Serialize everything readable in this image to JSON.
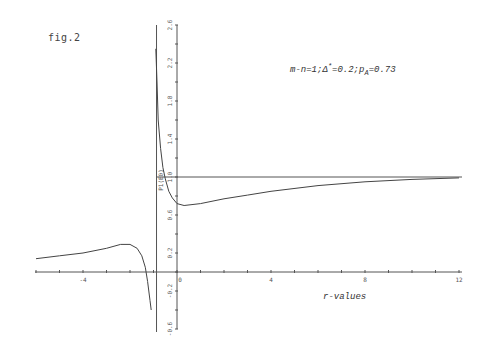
{
  "figure": {
    "label": "fig.2",
    "annotation": "m-n=1;Δ*=0.2;pA=0.73",
    "annotation_parts": {
      "prefix": "m-n=1;Δ",
      "sup": "*",
      "mid": "=0.2;p",
      "sub": "A",
      "suffix": "=0.73"
    },
    "xlabel": "r-values",
    "ylabel_rotated": "P1(E0)"
  },
  "chart_data": {
    "type": "line",
    "title": "fig.2",
    "annotation": "m-n=1; Δ*=0.2; p_A=0.73",
    "xlabel": "r-values",
    "ylabel": "",
    "xlim": [
      -6,
      12
    ],
    "ylim": [
      -0.6,
      2.6
    ],
    "x_ticks": [
      -4,
      0,
      4,
      8,
      12
    ],
    "x_tick_labels": [
      "-4",
      "0",
      "4",
      "8",
      "12"
    ],
    "y_ticks": [
      -0.6,
      -0.2,
      0.2,
      0.6,
      1.0,
      1.4,
      1.8,
      2.2,
      2.6
    ],
    "y_tick_labels": [
      "-0.6",
      "-0.2",
      "0.2",
      "0.6",
      "1.0",
      "1.4",
      "1.8",
      "2.2",
      "2.6"
    ],
    "grid": false,
    "reference_lines": [
      {
        "type": "horizontal",
        "y": 1.0
      },
      {
        "type": "vertical",
        "x": -0.85,
        "label": "asymptote"
      }
    ],
    "series": [
      {
        "name": "left-branch",
        "x": [
          -6,
          -5,
          -4,
          -3,
          -2.4,
          -2.0,
          -1.7,
          -1.5,
          -1.35,
          -1.25,
          -1.15,
          -1.1
        ],
        "values": [
          0.14,
          0.17,
          0.2,
          0.25,
          0.29,
          0.29,
          0.25,
          0.17,
          0.05,
          -0.1,
          -0.3,
          -0.4
        ]
      },
      {
        "name": "right-branch",
        "x": [
          -0.9,
          -0.85,
          -0.8,
          -0.7,
          -0.6,
          -0.5,
          -0.35,
          -0.2,
          0,
          0.3,
          1,
          2,
          3,
          4,
          6,
          8,
          10,
          12
        ],
        "values": [
          2.35,
          2.0,
          1.6,
          1.3,
          1.1,
          0.98,
          0.85,
          0.78,
          0.72,
          0.7,
          0.72,
          0.77,
          0.81,
          0.85,
          0.91,
          0.95,
          0.975,
          0.99
        ]
      }
    ]
  }
}
